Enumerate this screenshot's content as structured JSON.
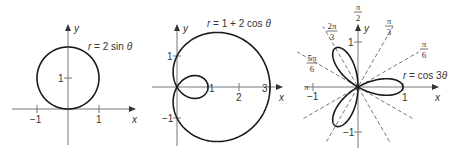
{
  "figure": {
    "panels": [
      {
        "id": "circle",
        "equation": "r = 2 sin θ",
        "equation_parts": [
          "r",
          " = 2 sin ",
          "θ"
        ],
        "origin": [
          68,
          109
        ],
        "scale": 31,
        "x_axis": {
          "from": 12,
          "to": 136,
          "label": "x"
        },
        "y_axis": {
          "from": 145,
          "to": 24,
          "label": "y"
        },
        "x_ticks": [
          {
            "value": -1,
            "label": "−1"
          },
          {
            "value": 1,
            "label": "1"
          }
        ],
        "y_ticks": [
          {
            "value": 1,
            "label": "1"
          }
        ],
        "equation_pos": [
          88,
          50
        ],
        "function": "2*sin(t)",
        "t_range": [
          0,
          3.14159
        ]
      },
      {
        "id": "limacon",
        "equation": "r = 1 + 2 cos θ",
        "equation_parts": [
          "r",
          " = 1 + 2 cos ",
          "θ"
        ],
        "origin": [
          177,
          87
        ],
        "scale": 31,
        "x_axis": {
          "from": 152,
          "to": 283,
          "label": "x"
        },
        "y_axis": {
          "from": 146,
          "to": 24,
          "label": "y"
        },
        "x_ticks": [
          {
            "value": 1,
            "label": "1"
          },
          {
            "value": 2,
            "label": "2"
          },
          {
            "value": 3,
            "label": "3"
          }
        ],
        "y_ticks": [
          {
            "value": 1,
            "label": "1"
          },
          {
            "value": -1,
            "label": "−1"
          }
        ],
        "equation_pos": [
          207,
          27
        ],
        "function": "1+2*cos(t)",
        "t_range": [
          0,
          6.28318
        ]
      },
      {
        "id": "rose",
        "equation": "r = cos 3θ",
        "equation_parts": [
          "r",
          " = cos 3",
          "θ"
        ],
        "origin": [
          358,
          87
        ],
        "scale": 45,
        "x_axis": {
          "from": 305,
          "to": 439,
          "label": "x"
        },
        "y_axis": {
          "from": 148,
          "to": 24,
          "label": "y"
        },
        "x_ticks": [
          {
            "value": -1,
            "label": "−1"
          },
          {
            "value": 1,
            "label": "1"
          }
        ],
        "y_ticks": [
          {
            "value": 1,
            "label": "1"
          },
          {
            "value": -1,
            "label": "−1"
          }
        ],
        "equation_pos": [
          403,
          79
        ],
        "function": "cos(3*t)",
        "t_range": [
          0,
          3.14159
        ],
        "angle_rays": [
          {
            "deg": 30,
            "num": "π",
            "den": "6",
            "pos": [
              424,
              47
            ]
          },
          {
            "deg": 60,
            "num": "π",
            "den": "3",
            "pos": [
              389,
              24
            ]
          },
          {
            "deg": 120,
            "num": "2π",
            "den": "3",
            "pos": [
              332,
              29
            ]
          },
          {
            "deg": 150,
            "num": "5π",
            "den": "6",
            "pos": [
              312,
              61
            ]
          }
        ],
        "axis_angle_labels": [
          {
            "label": "π/2",
            "num": "π",
            "den": "2",
            "pos": [
              358,
              10
            ]
          },
          {
            "label": "π",
            "text": "π",
            "pos": [
              304,
              90
            ]
          }
        ],
        "ray_length": 70
      }
    ]
  }
}
